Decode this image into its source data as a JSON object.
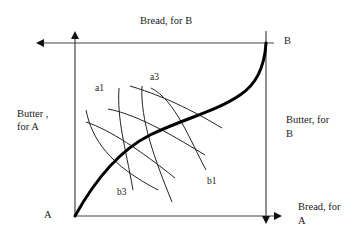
{
  "diagram": {
    "type": "edgeworth-box",
    "labels": {
      "top_axis": "Bread, for B",
      "origin_b": "B",
      "left_axis_line1": "Butter ,",
      "left_axis_line2": "for A",
      "right_axis_line1": "Butter, for",
      "right_axis_line2": "B",
      "origin_a": "A",
      "bottom_axis_line1": "Bread, for",
      "bottom_axis_line2": "A"
    },
    "curves": {
      "a1": "a1",
      "a3": "a3",
      "b1": "b1",
      "b3": "b3"
    },
    "colors": {
      "stroke": "#1a1a1a",
      "axis": "#444444"
    }
  }
}
